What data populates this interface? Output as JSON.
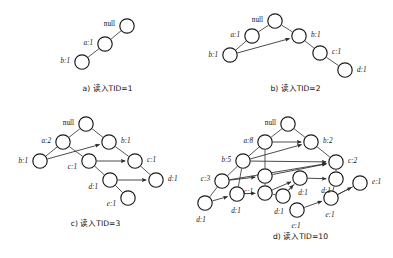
{
  "figure": {
    "colors": {
      "node_stroke": "#1a1a1a",
      "node_fill": "#ffffff",
      "edge": "#3a3a3a",
      "text": "#111111"
    }
  },
  "panels": [
    {
      "id": "a",
      "caption": "a) 读入TID=1",
      "nodes": [
        {
          "id": "a0",
          "label": "null",
          "cx": 127,
          "cy": 26,
          "r": 7.2,
          "lx": 115,
          "ly": 23,
          "anchor": "end"
        },
        {
          "id": "a1",
          "label": "a:1",
          "cx": 105,
          "cy": 44,
          "r": 7.2,
          "lx": 93,
          "ly": 42,
          "anchor": "end"
        },
        {
          "id": "a2",
          "label": "b:1",
          "cx": 82,
          "cy": 62,
          "r": 7.2,
          "lx": 70,
          "ly": 60,
          "anchor": "end"
        }
      ],
      "edges": [
        {
          "from": "a0",
          "to": "a1",
          "arrow": false
        },
        {
          "from": "a1",
          "to": "a2",
          "arrow": false
        }
      ]
    },
    {
      "id": "b",
      "caption": "b) 读入TID=2",
      "nodes": [
        {
          "id": "b0",
          "label": "null",
          "cx": 275,
          "cy": 21,
          "r": 7.2,
          "lx": 263,
          "ly": 19,
          "anchor": "end"
        },
        {
          "id": "b1",
          "label": "a:1",
          "cx": 252,
          "cy": 36,
          "r": 7.2,
          "lx": 240,
          "ly": 34,
          "anchor": "end"
        },
        {
          "id": "b2",
          "label": "b:1",
          "cx": 299,
          "cy": 36,
          "r": 7.2,
          "lx": 311,
          "ly": 34,
          "anchor": "start"
        },
        {
          "id": "b3",
          "label": "b:1",
          "cx": 230,
          "cy": 55,
          "r": 7.2,
          "lx": 218,
          "ly": 54,
          "anchor": "end"
        },
        {
          "id": "b4",
          "label": "c:1",
          "cx": 320,
          "cy": 53,
          "r": 7.2,
          "lx": 332,
          "ly": 51,
          "anchor": "start"
        },
        {
          "id": "b5",
          "label": "d:1",
          "cx": 345,
          "cy": 70,
          "r": 7.2,
          "lx": 357,
          "ly": 69,
          "anchor": "start"
        }
      ],
      "edges": [
        {
          "from": "b0",
          "to": "b1",
          "arrow": false
        },
        {
          "from": "b0",
          "to": "b2",
          "arrow": false
        },
        {
          "from": "b1",
          "to": "b3",
          "arrow": false
        },
        {
          "from": "b2",
          "to": "b4",
          "arrow": false
        },
        {
          "from": "b4",
          "to": "b5",
          "arrow": false
        },
        {
          "from": "b3",
          "to": "b2",
          "arrow": true
        }
      ]
    },
    {
      "id": "c",
      "caption": "c) 读入TID=3",
      "nodes": [
        {
          "id": "c0",
          "label": "null",
          "cx": 86,
          "cy": 124,
          "r": 7.2,
          "lx": 74,
          "ly": 122,
          "anchor": "end"
        },
        {
          "id": "c1",
          "label": "a:2",
          "cx": 63,
          "cy": 142,
          "r": 7.2,
          "lx": 51,
          "ly": 140,
          "anchor": "end"
        },
        {
          "id": "c2",
          "label": "b:1",
          "cx": 109,
          "cy": 142,
          "r": 7.2,
          "lx": 121,
          "ly": 140,
          "anchor": "start"
        },
        {
          "id": "c3",
          "label": "b:1",
          "cx": 40,
          "cy": 161,
          "r": 7.2,
          "lx": 28,
          "ly": 160,
          "anchor": "end"
        },
        {
          "id": "c4",
          "label": "c:1",
          "cx": 89,
          "cy": 161,
          "r": 7.2,
          "lx": 77,
          "ly": 166,
          "anchor": "end"
        },
        {
          "id": "c5",
          "label": "c:1",
          "cx": 135,
          "cy": 161,
          "r": 7.2,
          "lx": 147,
          "ly": 159,
          "anchor": "start"
        },
        {
          "id": "c6",
          "label": "d:1",
          "cx": 110,
          "cy": 180,
          "r": 7.2,
          "lx": 98,
          "ly": 186,
          "anchor": "end"
        },
        {
          "id": "c7",
          "label": "d:1",
          "cx": 156,
          "cy": 180,
          "r": 7.2,
          "lx": 168,
          "ly": 178,
          "anchor": "start"
        },
        {
          "id": "c8",
          "label": "e:1",
          "cx": 128,
          "cy": 198,
          "r": 7.2,
          "lx": 116,
          "ly": 203,
          "anchor": "end"
        }
      ],
      "edges": [
        {
          "from": "c0",
          "to": "c1",
          "arrow": false
        },
        {
          "from": "c0",
          "to": "c2",
          "arrow": false
        },
        {
          "from": "c1",
          "to": "c3",
          "arrow": false
        },
        {
          "from": "c1",
          "to": "c4",
          "arrow": false
        },
        {
          "from": "c2",
          "to": "c5",
          "arrow": false
        },
        {
          "from": "c4",
          "to": "c6",
          "arrow": false
        },
        {
          "from": "c6",
          "to": "c8",
          "arrow": false
        },
        {
          "from": "c3",
          "to": "c2",
          "arrow": true
        },
        {
          "from": "c4",
          "to": "c5",
          "arrow": true
        },
        {
          "from": "c6",
          "to": "c7",
          "arrow": true
        },
        {
          "from": "c5",
          "to": "c7",
          "arrow": false
        }
      ]
    },
    {
      "id": "d",
      "caption": "d) 读入TID=10",
      "nodes": [
        {
          "id": "d0",
          "label": "null",
          "cx": 288,
          "cy": 124,
          "r": 7.2,
          "lx": 276,
          "ly": 122,
          "anchor": "end"
        },
        {
          "id": "d1",
          "label": "a:8",
          "cx": 265,
          "cy": 142,
          "r": 7.2,
          "lx": 253,
          "ly": 140,
          "anchor": "end"
        },
        {
          "id": "d2",
          "label": "b:2",
          "cx": 311,
          "cy": 142,
          "r": 7.2,
          "lx": 323,
          "ly": 140,
          "anchor": "start"
        },
        {
          "id": "d3",
          "label": "b:5",
          "cx": 243,
          "cy": 161,
          "r": 7.2,
          "lx": 231,
          "ly": 159,
          "anchor": "end"
        },
        {
          "id": "d4",
          "label": "c:2",
          "cx": 336,
          "cy": 162,
          "r": 7.2,
          "lx": 348,
          "ly": 160,
          "anchor": "start"
        },
        {
          "id": "d5",
          "label": "c:3",
          "cx": 222,
          "cy": 181,
          "r": 7.2,
          "lx": 210,
          "ly": 178,
          "anchor": "end"
        },
        {
          "id": "d6",
          "label": "",
          "cx": 265,
          "cy": 176,
          "r": 7.2,
          "lx": 0,
          "ly": 0,
          "anchor": "end"
        },
        {
          "id": "d7",
          "label": "c:1",
          "cx": 265,
          "cy": 193,
          "r": 7.2,
          "lx": 253,
          "ly": 191,
          "anchor": "end"
        },
        {
          "id": "d8",
          "label": "d:1",
          "cx": 237,
          "cy": 194,
          "r": 7.2,
          "lx": 236,
          "ly": 210,
          "anchor": "middle"
        },
        {
          "id": "d9",
          "label": "d:1",
          "cx": 205,
          "cy": 203,
          "r": 7.2,
          "lx": 201,
          "ly": 219,
          "anchor": "middle"
        },
        {
          "id": "d10",
          "label": "d:1",
          "cx": 300,
          "cy": 178,
          "r": 7.2,
          "lx": 303,
          "ly": 192,
          "anchor": "middle"
        },
        {
          "id": "d11",
          "label": "d:1",
          "cx": 336,
          "cy": 179,
          "r": 7.2,
          "lx": 326,
          "ly": 190,
          "anchor": "middle"
        },
        {
          "id": "d12",
          "label": "e:1",
          "cx": 360,
          "cy": 183,
          "r": 7.2,
          "lx": 372,
          "ly": 181,
          "anchor": "start"
        },
        {
          "id": "d13",
          "label": "d:1",
          "cx": 283,
          "cy": 196,
          "r": 7.2,
          "lx": 279,
          "ly": 211,
          "anchor": "middle"
        },
        {
          "id": "d14",
          "label": "e:1",
          "cx": 331,
          "cy": 198,
          "r": 7.2,
          "lx": 330,
          "ly": 214,
          "anchor": "middle"
        },
        {
          "id": "d15",
          "label": "e:1",
          "cx": 297,
          "cy": 210,
          "r": 7.2,
          "lx": 296,
          "ly": 225,
          "anchor": "middle"
        }
      ],
      "edges": [
        {
          "from": "d0",
          "to": "d1",
          "arrow": false
        },
        {
          "from": "d0",
          "to": "d2",
          "arrow": false
        },
        {
          "from": "d1",
          "to": "d3",
          "arrow": false
        },
        {
          "from": "d1",
          "to": "d6",
          "arrow": false
        },
        {
          "from": "d2",
          "to": "d4",
          "arrow": false
        },
        {
          "from": "d3",
          "to": "d5",
          "arrow": false
        },
        {
          "from": "d3",
          "to": "d8",
          "arrow": false
        },
        {
          "from": "d5",
          "to": "d9",
          "arrow": false
        },
        {
          "from": "d6",
          "to": "d7",
          "arrow": false
        },
        {
          "from": "d7",
          "to": "d13",
          "arrow": false
        },
        {
          "from": "d10",
          "to": "d13",
          "arrow": false
        },
        {
          "from": "d4",
          "to": "d11",
          "arrow": false
        },
        {
          "from": "d11",
          "to": "d14",
          "arrow": false
        },
        {
          "from": "d12",
          "to": "d14",
          "arrow": false
        },
        {
          "from": "d1",
          "to": "d2",
          "arrow": true
        },
        {
          "from": "d3",
          "to": "d2",
          "arrow": true
        },
        {
          "from": "d6",
          "to": "d4",
          "arrow": true
        },
        {
          "from": "d5",
          "to": "d6",
          "arrow": true
        },
        {
          "from": "d5",
          "to": "d4",
          "arrow": true
        },
        {
          "from": "d9",
          "to": "d8",
          "arrow": true
        },
        {
          "from": "d8",
          "to": "d7",
          "arrow": true
        },
        {
          "from": "d7",
          "to": "d10",
          "arrow": true
        },
        {
          "from": "d10",
          "to": "d11",
          "arrow": true
        },
        {
          "from": "d13",
          "to": "d10",
          "arrow": true
        },
        {
          "from": "d15",
          "to": "d14",
          "arrow": true
        },
        {
          "from": "d14",
          "to": "d12",
          "arrow": true
        },
        {
          "from": "d3",
          "to": "d4",
          "arrow": true
        }
      ]
    }
  ],
  "captions": {
    "a": {
      "text": "a) 读入TID=1",
      "x": 60,
      "y": 82,
      "w": 95
    },
    "b": {
      "text": "b) 读入TID=2",
      "x": 248,
      "y": 82,
      "w": 95
    },
    "c": {
      "text": "c) 读入TID=3",
      "x": 48,
      "y": 217,
      "w": 95
    },
    "d": {
      "text": "d) 读入TID=10",
      "x": 253,
      "y": 230,
      "w": 95
    }
  }
}
